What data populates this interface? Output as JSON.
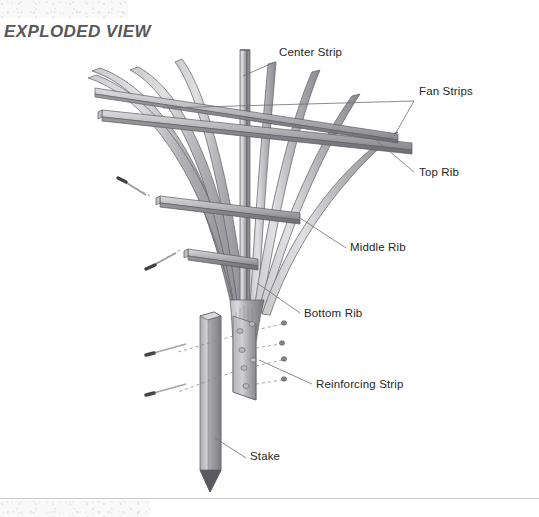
{
  "page": {
    "title": "EXPLODED VIEW",
    "background_color": "#ffffff",
    "rule_color": "#c9c9cc"
  },
  "colors": {
    "wood_light": "#d8d8da",
    "wood_mid": "#a8a8ac",
    "wood_dark": "#76767b",
    "wood_edge": "#5c5c61",
    "outline": "#55555a",
    "leader_line": "#6e6e73",
    "dashed_line": "#8c8c92",
    "fastener": "#4a4a4f",
    "label_text": "#262628",
    "title_text": "#58585a"
  },
  "callouts": [
    {
      "id": "center-strip",
      "label": "Center Strip",
      "x": 279,
      "y": 54,
      "leader": {
        "x1": 275,
        "y1": 62,
        "x2": 243,
        "y2": 76
      }
    },
    {
      "id": "fan-strips",
      "label": "Fan Strips",
      "x": 419,
      "y": 93,
      "leader": {
        "x1": 414,
        "y1": 101,
        "x2": 163,
        "y2": 108
      },
      "leader2": {
        "x1": 414,
        "y1": 101,
        "x2": 394,
        "y2": 136
      }
    },
    {
      "id": "top-rib",
      "label": "Top Rib",
      "x": 419,
      "y": 174,
      "leader": {
        "x1": 414,
        "y1": 172,
        "x2": 376,
        "y2": 140
      }
    },
    {
      "id": "middle-rib",
      "label": "Middle Rib",
      "x": 350,
      "y": 249,
      "leader": {
        "x1": 346,
        "y1": 248,
        "x2": 300,
        "y2": 218
      }
    },
    {
      "id": "bottom-rib",
      "label": "Bottom Rib",
      "x": 304,
      "y": 315,
      "leader": {
        "x1": 300,
        "y1": 313,
        "x2": 257,
        "y2": 283
      }
    },
    {
      "id": "reinforcing-strip",
      "label": "Reinforcing Strip",
      "x": 316,
      "y": 386,
      "leader": {
        "x1": 312,
        "y1": 384,
        "x2": 259,
        "y2": 360
      }
    },
    {
      "id": "stake",
      "label": "Stake",
      "x": 250,
      "y": 458,
      "leader": {
        "x1": 246,
        "y1": 458,
        "x2": 215,
        "y2": 438
      }
    }
  ],
  "parts": {
    "center_strip": {
      "name": "Center Strip",
      "count": 1
    },
    "fan_strips": {
      "name": "Fan Strips",
      "count": 8
    },
    "top_rib": {
      "name": "Top Rib",
      "count": 1
    },
    "middle_rib": {
      "name": "Middle Rib",
      "count": 1
    },
    "bottom_rib": {
      "name": "Bottom Rib",
      "count": 1
    },
    "reinforcing_strip": {
      "name": "Reinforcing Strip",
      "count": 1
    },
    "stake": {
      "name": "Stake",
      "count": 1
    },
    "fasteners": {
      "name": "Screws",
      "count": 9
    }
  }
}
